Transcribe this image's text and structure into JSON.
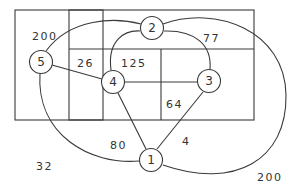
{
  "diagram": {
    "type": "graph-on-region-map",
    "stroke_color": "#3a3a3a",
    "background": "#ffffff",
    "nodes": [
      {
        "id": "1",
        "label": "1",
        "x": 151,
        "y": 160
      },
      {
        "id": "2",
        "label": "2",
        "x": 152,
        "y": 28
      },
      {
        "id": "3",
        "label": "3",
        "x": 209,
        "y": 81
      },
      {
        "id": "4",
        "label": "4",
        "x": 113,
        "y": 82
      },
      {
        "id": "5",
        "label": "5",
        "x": 41,
        "y": 62
      }
    ],
    "region_labels": [
      {
        "text": "200",
        "x": 32,
        "y": 36
      },
      {
        "text": "77",
        "x": 203,
        "y": 38
      },
      {
        "text": "26",
        "x": 76,
        "y": 63
      },
      {
        "text": "125",
        "x": 122,
        "y": 63
      },
      {
        "text": "64",
        "x": 169,
        "y": 104
      },
      {
        "text": "80",
        "x": 110,
        "y": 145
      },
      {
        "text": "4",
        "x": 182,
        "y": 141
      },
      {
        "text": "32",
        "x": 36,
        "y": 166
      },
      {
        "text": "200",
        "x": 257,
        "y": 177
      }
    ],
    "edges": [
      {
        "from": "5",
        "to": "4",
        "shape": "line"
      },
      {
        "from": "4",
        "to": "3",
        "shape": "line"
      },
      {
        "from": "4",
        "to": "1",
        "shape": "line"
      },
      {
        "from": "3",
        "to": "1",
        "shape": "line"
      },
      {
        "from": "4",
        "to": "2",
        "shape": "arc"
      },
      {
        "from": "2",
        "to": "3",
        "shape": "arc"
      },
      {
        "from": "5",
        "to": "2",
        "shape": "arc"
      },
      {
        "from": "5",
        "to": "1",
        "shape": "arc"
      },
      {
        "from": "2",
        "to": "1",
        "shape": "outer-arc"
      }
    ]
  },
  "labels": {
    "n1": "1",
    "n2": "2",
    "n3": "3",
    "n4": "4",
    "n5": "5",
    "r200a": "200",
    "r77": "77",
    "r26": "26",
    "r125": "125",
    "r64": "64",
    "r80": "80",
    "r4": "4",
    "r32": "32",
    "r200b": "200"
  }
}
